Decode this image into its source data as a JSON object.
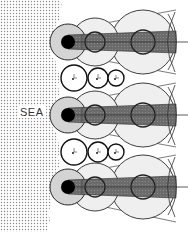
{
  "diagram": {
    "sea_label": "SEA",
    "colors": {
      "sea_dots": "#9a9a9a",
      "land_bg": "#ffffff",
      "shaded_zone": "#d6d6d6",
      "light_circle": "#ececec",
      "dark_band": "#6b6b6b",
      "source_dot": "#000000",
      "stroke": "#2a2a2a",
      "axis_line": "#333333"
    },
    "sources": [
      {
        "id": "source-1",
        "y": 42
      },
      {
        "id": "source-2",
        "y": 115
      },
      {
        "id": "source-3",
        "y": 187
      }
    ],
    "small_circle_rows": [
      {
        "id": "row-a",
        "y": 78
      },
      {
        "id": "row-b",
        "y": 152
      }
    ]
  }
}
